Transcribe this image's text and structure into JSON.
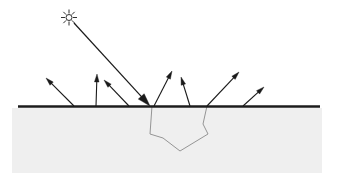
{
  "figure": {
    "canvas": {
      "width": 338,
      "height": 173,
      "background": "#ffffff"
    }
  },
  "colors": {
    "ink": "#1a1a1a",
    "surface_line": "#1c1c1c",
    "ground_fill": "#efefef",
    "subsurface_stroke": "#8a8a8a",
    "sun_stroke": "#1a1a1a",
    "background": "#ffffff"
  },
  "ground": {
    "label": "substrate",
    "x": 12,
    "y": 108,
    "width": 310,
    "height": 65,
    "fill": "#efefef"
  },
  "surface_line": {
    "label": "surface-interface",
    "x1": 18,
    "y1": 106.5,
    "x2": 320,
    "y2": 106.5,
    "stroke_width": 2.4
  },
  "sun": {
    "label": "light-source",
    "cx": 69,
    "cy": 17.5,
    "core_radius": 3.0,
    "ray_inner": 4.4,
    "ray_outer": 7.6,
    "ray_count": 8,
    "stroke_width": 0.9
  },
  "incident_ray": {
    "label": "incident-ray",
    "x1": 74,
    "y1": 23,
    "x2": 150,
    "y2": 106,
    "stroke_width": 1.2,
    "head_length": 13,
    "head_width": 8
  },
  "scattered_rays": [
    {
      "id": 1,
      "label": "scattered-ray-1",
      "x1": 74,
      "y1": 106,
      "x2": 46,
      "y2": 78,
      "stroke_width": 1.1,
      "head_length": 8,
      "head_width": 4.6
    },
    {
      "id": 2,
      "label": "scattered-ray-2",
      "x1": 96,
      "y1": 106,
      "x2": 97,
      "y2": 74,
      "stroke_width": 1.1,
      "head_length": 8,
      "head_width": 4.6
    },
    {
      "id": 3,
      "label": "scattered-ray-3",
      "x1": 129,
      "y1": 106,
      "x2": 104,
      "y2": 80,
      "stroke_width": 1.1,
      "head_length": 8,
      "head_width": 4.6
    },
    {
      "id": 4,
      "label": "scattered-ray-4",
      "x1": 154,
      "y1": 106,
      "x2": 172,
      "y2": 71,
      "stroke_width": 1.1,
      "head_length": 8,
      "head_width": 4.6
    },
    {
      "id": 5,
      "label": "scattered-ray-5",
      "x1": 190,
      "y1": 106,
      "x2": 181,
      "y2": 77,
      "stroke_width": 1.1,
      "head_length": 8,
      "head_width": 4.6
    },
    {
      "id": 6,
      "label": "scattered-ray-6",
      "x1": 207,
      "y1": 106,
      "x2": 239,
      "y2": 72,
      "stroke_width": 1.1,
      "head_length": 8,
      "head_width": 4.6
    },
    {
      "id": 7,
      "label": "scattered-ray-7",
      "x1": 243,
      "y1": 106,
      "x2": 264,
      "y2": 87,
      "stroke_width": 1.1,
      "head_length": 8,
      "head_width": 4.6
    }
  ],
  "subsurface_path": {
    "label": "subsurface-scattering-path",
    "points": "152,106 150,134 163,138 180,151 208,134 203,124 207,106",
    "stroke_width": 0.9
  }
}
